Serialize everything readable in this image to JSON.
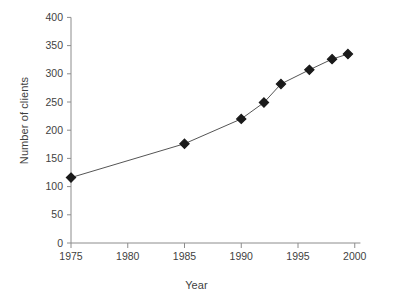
{
  "chart_data": {
    "type": "line",
    "title": "",
    "subtitle": "",
    "xlabel": "Year",
    "ylabel": "Number of clients",
    "xlim": [
      1974,
      2000.5
    ],
    "ylim": [
      0,
      400
    ],
    "xticks": [
      1975,
      1980,
      1985,
      1990,
      1995,
      2000
    ],
    "xtick_labels": [
      "1975",
      "1980",
      "1985",
      "1990",
      "1995",
      "2000"
    ],
    "yticks": [
      0,
      50,
      100,
      150,
      200,
      250,
      300,
      350,
      400
    ],
    "ytick_labels": [
      "0",
      "50",
      "100",
      "150",
      "200",
      "250",
      "300",
      "350",
      "400"
    ],
    "grid": false,
    "legend": null,
    "legend_position": "none",
    "marker": "diamond",
    "marker_color": "#1a1a1a",
    "line_color": "#555555",
    "series": [
      {
        "name": "Number of clients",
        "x": [
          1975,
          1985,
          1990,
          1992,
          1993.5,
          1996,
          1998,
          1999.4
        ],
        "values": [
          116,
          176,
          220,
          249,
          282,
          307,
          326,
          335
        ]
      }
    ],
    "points": [
      {
        "x": 1975,
        "y": 116
      },
      {
        "x": 1985,
        "y": 176
      },
      {
        "x": 1990,
        "y": 220
      },
      {
        "x": 1992,
        "y": 249
      },
      {
        "x": 1993.5,
        "y": 282
      },
      {
        "x": 1996,
        "y": 307
      },
      {
        "x": 1998,
        "y": 326
      },
      {
        "x": 1999.4,
        "y": 335
      }
    ]
  },
  "axes": {
    "x_title": "Year",
    "y_title": "Number of clients"
  },
  "colors": {
    "background": "#ffffff",
    "axis": "#8c8c8c",
    "text": "#3f3f3f",
    "marker": "#1a1a1a",
    "line": "#555555"
  }
}
